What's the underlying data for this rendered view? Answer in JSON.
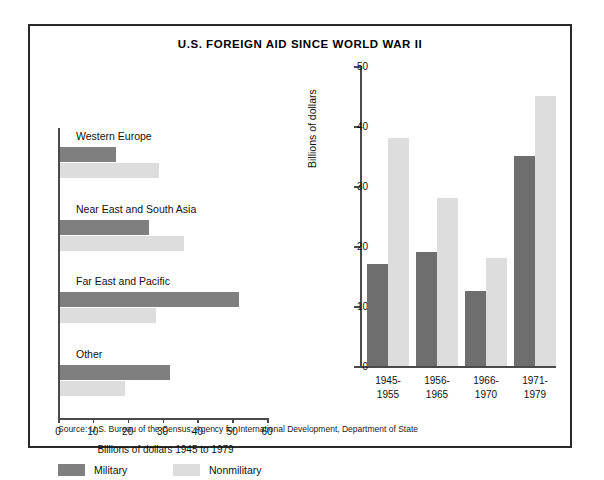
{
  "title": "U.S. FOREIGN AID SINCE WORLD WAR II",
  "source": "Source: U.S. Bureau of the Census; Agency for International Development, Department of State",
  "colors": {
    "military": "#7f7f7f",
    "nonmilitary": "#dddddd",
    "axis": "#4a4a4a",
    "frame": "#2a2a2a"
  },
  "legend": {
    "military_label": "Military",
    "nonmilitary_label": "Nonmilitary"
  },
  "chart_data": [
    {
      "type": "bar",
      "orientation": "horizontal",
      "title": "",
      "xlabel": "Billions of dollars 1945 to 1979",
      "ylabel": "",
      "xlim": [
        0,
        60
      ],
      "xticks": [
        0,
        10,
        20,
        30,
        40,
        50,
        60
      ],
      "grid": false,
      "legend_position": "bottom",
      "categories": [
        "Western Europe",
        "Near East and South Asia",
        "Far East and Pacific",
        "Other"
      ],
      "series": [
        {
          "name": "Military",
          "values": [
            16.0,
            25.5,
            51.5,
            31.5
          ]
        },
        {
          "name": "Nonmilitary",
          "values": [
            28.5,
            35.5,
            27.5,
            18.7
          ]
        }
      ]
    },
    {
      "type": "bar",
      "orientation": "vertical",
      "title": "",
      "xlabel": "",
      "ylabel": "Billions of dollars",
      "ylim": [
        0,
        50
      ],
      "yticks": [
        0,
        10,
        20,
        30,
        40,
        50
      ],
      "grid": false,
      "legend_position": "shared-bottom-left",
      "categories": [
        "1945-1955",
        "1956-1965",
        "1966-1970",
        "1971-1979"
      ],
      "category_lines": [
        [
          "1945-",
          "1955"
        ],
        [
          "1956-",
          "1965"
        ],
        [
          "1966-",
          "1970"
        ],
        [
          "1971-",
          "1979"
        ]
      ],
      "series": [
        {
          "name": "Military",
          "values": [
            17.0,
            19.0,
            12.5,
            35.0
          ]
        },
        {
          "name": "Nonmilitary",
          "values": [
            38.0,
            28.0,
            18.0,
            45.0
          ]
        }
      ]
    }
  ]
}
